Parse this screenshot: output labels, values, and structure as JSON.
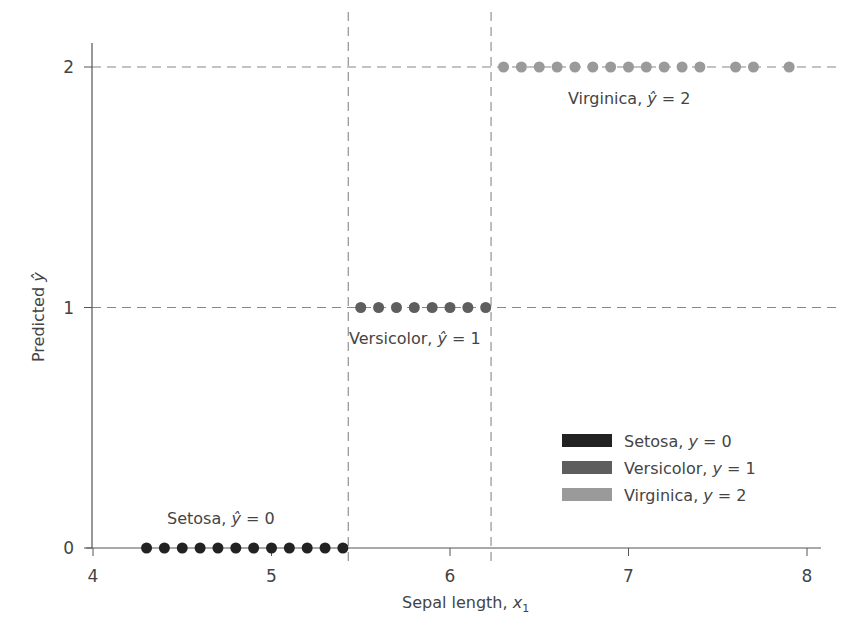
{
  "chart_data": {
    "type": "scatter",
    "title": "",
    "xlabel": "Sepal length, x1",
    "ylabel": "Predicted ŷ",
    "xlim": [
      4,
      8
    ],
    "ylim": [
      0,
      2
    ],
    "xticks": [
      4,
      5,
      6,
      7,
      8
    ],
    "yticks": [
      0,
      1,
      2
    ],
    "grid": "dashed lines at y=1, y=2 and vertical decision boundaries",
    "decision_boundaries": [
      5.43,
      6.23
    ],
    "series": [
      {
        "name": "Setosa, y = 0",
        "color": "#222222",
        "y": 0,
        "x": [
          4.3,
          4.4,
          4.5,
          4.6,
          4.7,
          4.8,
          4.9,
          5.0,
          5.1,
          5.2,
          5.3,
          5.4
        ]
      },
      {
        "name": "Versicolor, y = 1",
        "color": "#5e5e5e",
        "y": 1,
        "x": [
          5.5,
          5.6,
          5.7,
          5.8,
          5.9,
          6.0,
          6.1,
          6.2
        ]
      },
      {
        "name": "Virginica, y = 2",
        "color": "#9a9a9a",
        "y": 2,
        "x": [
          6.3,
          6.4,
          6.5,
          6.6,
          6.7,
          6.8,
          6.9,
          7.0,
          7.1,
          7.2,
          7.3,
          7.4,
          7.6,
          7.7,
          7.9
        ]
      }
    ],
    "annotations": [
      {
        "text_prefix": "Setosa, ",
        "text_suffix": " = 0",
        "region": "setosa"
      },
      {
        "text_prefix": "Versicolor, ",
        "text_suffix": " = 1",
        "region": "versicolor"
      },
      {
        "text_prefix": "Virginica, ",
        "text_suffix": " = 2",
        "region": "virginica"
      }
    ],
    "legend": {
      "position": "lower right",
      "entries": [
        {
          "prefix": "Setosa, ",
          "var": "y",
          "suffix": " = 0",
          "color": "#222222"
        },
        {
          "prefix": "Versicolor, ",
          "var": "y",
          "suffix": " = 1",
          "color": "#5e5e5e"
        },
        {
          "prefix": "Virginica, ",
          "var": "y",
          "suffix": " = 2",
          "color": "#9a9a9a"
        }
      ]
    }
  },
  "labels": {
    "xlabel_main": "Sepal length, ",
    "xlabel_var": "x",
    "xlabel_sub": "1",
    "ylabel_main": "Predicted ",
    "ylabel_var": "ŷ",
    "hat_var": "ŷ",
    "tick_x": [
      "4",
      "5",
      "6",
      "7",
      "8"
    ],
    "tick_y": [
      "0",
      "1",
      "2"
    ]
  }
}
